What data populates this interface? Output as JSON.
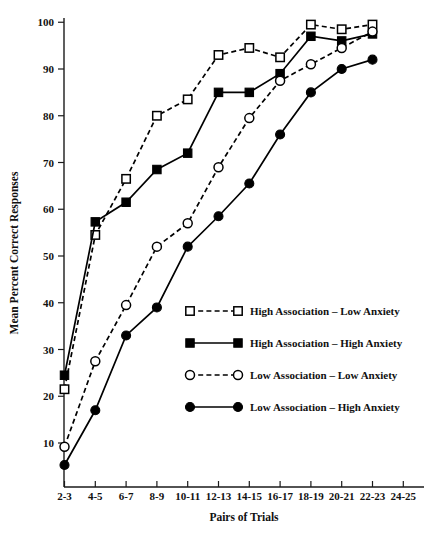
{
  "chart_data": {
    "type": "line",
    "title": "",
    "xlabel": "Pairs of Trials",
    "ylabel": "Mean Percent Correct Responses",
    "categories": [
      "2-3",
      "4-5",
      "6-7",
      "8-9",
      "10-11",
      "12-13",
      "14-15",
      "16-17",
      "18-19",
      "20-21",
      "22-23",
      "24-25"
    ],
    "ylim": [
      0,
      100
    ],
    "yticks": [
      10,
      20,
      30,
      40,
      50,
      60,
      70,
      80,
      90,
      100
    ],
    "ytick_labels": [
      "10",
      "20",
      "30",
      "40",
      "50",
      "60",
      "70",
      "80",
      "90",
      "100"
    ],
    "grid": false,
    "legend_position": "center-right-inside",
    "series": [
      {
        "name": "High Association – Low Anxiety",
        "marker": "open-square",
        "line": "dashed",
        "values": [
          21.5,
          54.5,
          66.5,
          80.0,
          83.5,
          93.0,
          94.5,
          92.5,
          99.5,
          98.5,
          99.5,
          null
        ]
      },
      {
        "name": "High Association – High Anxiety",
        "marker": "filled-square",
        "line": "solid",
        "values": [
          24.5,
          57.3,
          61.5,
          68.5,
          72.0,
          85.0,
          85.0,
          89.0,
          97.0,
          96.0,
          97.5,
          null
        ]
      },
      {
        "name": "Low Association – Low Anxiety",
        "marker": "open-circle",
        "line": "dashed",
        "values": [
          9.2,
          27.5,
          39.5,
          52.0,
          57.0,
          69.0,
          79.5,
          87.5,
          91.0,
          94.5,
          98.0,
          null
        ]
      },
      {
        "name": "Low Association – High Anxiety",
        "marker": "filled-circle",
        "line": "solid",
        "values": [
          5.3,
          17.0,
          33.0,
          39.0,
          52.0,
          58.5,
          65.5,
          76.0,
          85.0,
          90.0,
          92.0,
          null
        ]
      }
    ]
  },
  "legend": {
    "items": [
      {
        "label": "High Association – Low Anxiety",
        "marker": "open-square",
        "line": "dashed"
      },
      {
        "label": "High Association – High Anxiety",
        "marker": "filled-square",
        "line": "solid"
      },
      {
        "label": "Low Association – Low Anxiety",
        "marker": "open-circle",
        "line": "dashed"
      },
      {
        "label": "Low Association – High Anxiety",
        "marker": "filled-circle",
        "line": "solid"
      }
    ]
  },
  "colors": {
    "ink": "#000000",
    "background": "#ffffff"
  }
}
